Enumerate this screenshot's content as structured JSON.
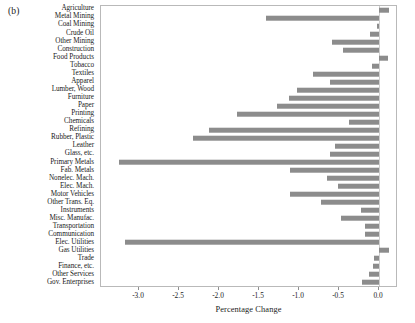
{
  "figure": {
    "panel_label": "(b)"
  },
  "chart_data": {
    "type": "bar",
    "orientation": "horizontal",
    "title": "",
    "xlabel": "Percentage Change",
    "ylabel": "",
    "xlim": [
      -3.475,
      0.2375
    ],
    "xticks": [
      -3.0,
      -2.5,
      -2.0,
      -1.5,
      -1.0,
      -0.5,
      0.0
    ],
    "xticklabels": [
      "-3.0",
      "-2.5",
      "-2.0",
      "-1.5",
      "-1.0",
      "-0.5",
      "0.0"
    ],
    "grid": false,
    "legend": null,
    "bar_color": "#8c8c8c",
    "categories": [
      "Agriculture",
      "Metal Mining",
      "Coal Mining",
      "Crude Oil",
      "Other Mining",
      "Construction",
      "Food Products",
      "Tobacco",
      "Textiles",
      "Apparel",
      "Lumber, Wood",
      "Furniture",
      "Paper",
      "Printing",
      "Chemicals",
      "Refining",
      "Rubber, Plastic",
      "Leather",
      "Glass, etc.",
      "Primary Metals",
      "Fab. Metals",
      "Nonelec. Mach.",
      "Elec. Mach.",
      "Motor Vehicles",
      "Other Trans. Eq.",
      "Instruments",
      "Misc. Manufac.",
      "Transportation",
      "Communication",
      "Elec. Utilities",
      "Gas Utilities",
      "Trade",
      "Finance, etc.",
      "Other Services",
      "Gov. Enterprises"
    ],
    "values": [
      0.12,
      -1.41,
      -0.03,
      -0.11,
      -0.59,
      -0.45,
      0.11,
      -0.09,
      -0.83,
      -0.61,
      -1.03,
      -1.13,
      -1.27,
      -1.78,
      -0.37,
      -2.12,
      -2.33,
      -0.55,
      -0.61,
      -3.25,
      -1.11,
      -0.65,
      -0.51,
      -1.11,
      -0.73,
      -0.23,
      -0.47,
      -0.18,
      -0.18,
      -3.18,
      0.12,
      -0.06,
      -0.07,
      -0.12,
      -0.21
    ]
  }
}
